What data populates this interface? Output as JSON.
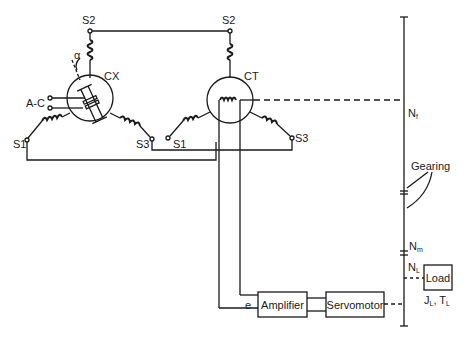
{
  "diagram": {
    "type": "synchro servo system schematic",
    "components": {
      "transmitter": {
        "label": "CX",
        "stator_terminals": [
          "S1",
          "S2",
          "S3"
        ],
        "rotor_input": "A-C",
        "angle": "α"
      },
      "control_transformer": {
        "label": "CT",
        "stator_terminals": [
          "S1",
          "S2",
          "S3"
        ]
      },
      "amplifier": {
        "label": "Amplifier",
        "input_signal": "e"
      },
      "servomotor": {
        "label": "Servomotor"
      },
      "load": {
        "label": "Load",
        "params": "J",
        "params_sub": "L",
        "params2": "T",
        "params2_sub": "L"
      }
    },
    "labels": {
      "cx_s2": "S2",
      "cx_s1": "S1",
      "cx_s3": "S3",
      "cx": "CX",
      "ac": "A-C",
      "alpha": "α",
      "ct_s2": "S2",
      "ct_s1": "S1",
      "ct_s3": "S3",
      "ct": "CT",
      "e": "e",
      "nf": "N",
      "nf_sub": "f",
      "gearing": "Gearing",
      "nm": "N",
      "nm_sub": "m",
      "nl": "N",
      "nl_sub": "L",
      "load_j": "J",
      "load_j_sub": "L",
      "load_sep": ",",
      "load_t": "T",
      "load_t_sub": "L"
    },
    "colors": {
      "ink": "#1a1a1a",
      "background": "#ffffff"
    }
  }
}
